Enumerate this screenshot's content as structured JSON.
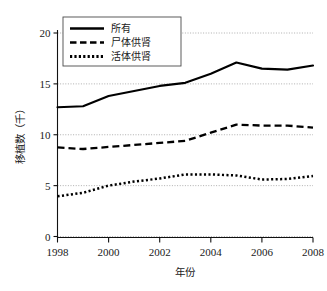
{
  "chart_data": {
    "type": "line",
    "title": "",
    "xlabel": "年份",
    "ylabel": "移植数（千）",
    "x": [
      1998,
      1999,
      2000,
      2001,
      2002,
      2003,
      2004,
      2005,
      2006,
      2007,
      2008
    ],
    "xlim": [
      1998,
      2008
    ],
    "ylim": [
      0,
      20
    ],
    "xticks": [
      "1998",
      "2000",
      "2002",
      "2004",
      "2006",
      "2008"
    ],
    "xtick_values": [
      1998,
      2000,
      2002,
      2004,
      2006,
      2008
    ],
    "yticks": [
      "0",
      "5",
      "10",
      "15",
      "20"
    ],
    "ytick_values": [
      0,
      5,
      10,
      15,
      20
    ],
    "grid": "horizontal-dotted",
    "legend_position": "upper-left-inside",
    "series": [
      {
        "name": "所有",
        "style": "solid",
        "values": [
          12.7,
          12.8,
          13.8,
          14.3,
          14.8,
          15.1,
          16.0,
          17.1,
          16.5,
          16.4,
          16.8
        ]
      },
      {
        "name": "尸体供肾",
        "style": "dashed",
        "values": [
          8.75,
          8.6,
          8.8,
          9.0,
          9.2,
          9.4,
          10.2,
          11.0,
          10.9,
          10.9,
          10.7
        ]
      },
      {
        "name": "活体供肾",
        "style": "dotted",
        "values": [
          3.95,
          4.3,
          5.0,
          5.4,
          5.7,
          6.1,
          6.1,
          6.0,
          5.6,
          5.65,
          5.95
        ]
      }
    ]
  },
  "legend": {
    "items": [
      {
        "label": "所有",
        "style": "solid"
      },
      {
        "label": "尸体供肾",
        "style": "dashed"
      },
      {
        "label": "活体供肾",
        "style": "dotted"
      }
    ]
  },
  "axes": {
    "x_title": "年份",
    "y_title": "移植数（千）"
  }
}
